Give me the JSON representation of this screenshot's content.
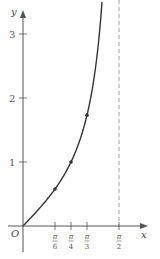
{
  "chart_data": {
    "type": "line",
    "title": "",
    "function": "y = tan x",
    "xlabel": "x",
    "ylabel": "y",
    "origin_label": "O",
    "xlim": [
      0,
      1.62
    ],
    "ylim": [
      -0.45,
      3.55
    ],
    "grid": false,
    "legend": null,
    "x_ticks": [
      {
        "value": 0.5236,
        "num": "π",
        "den": "6"
      },
      {
        "value": 0.7854,
        "num": "π",
        "den": "4"
      },
      {
        "value": 1.0472,
        "num": "π",
        "den": "3"
      },
      {
        "value": 1.5708,
        "num": "π",
        "den": "2"
      }
    ],
    "y_ticks": [
      {
        "value": 1,
        "label": "1"
      },
      {
        "value": 2,
        "label": "2"
      },
      {
        "value": 3,
        "label": "3"
      }
    ],
    "asymptote": {
      "x": 1.5708,
      "label": "x = π/2",
      "style": "dashed"
    },
    "highlighted_points": [
      {
        "x": 0.5236,
        "x_label": "π/6",
        "y": 0.577
      },
      {
        "x": 0.7854,
        "x_label": "π/4",
        "y": 1.0
      },
      {
        "x": 1.0472,
        "x_label": "π/3",
        "y": 1.732
      }
    ],
    "colors": {
      "curve": "#333333",
      "axis": "#555555",
      "asymptote": "#777777"
    }
  }
}
